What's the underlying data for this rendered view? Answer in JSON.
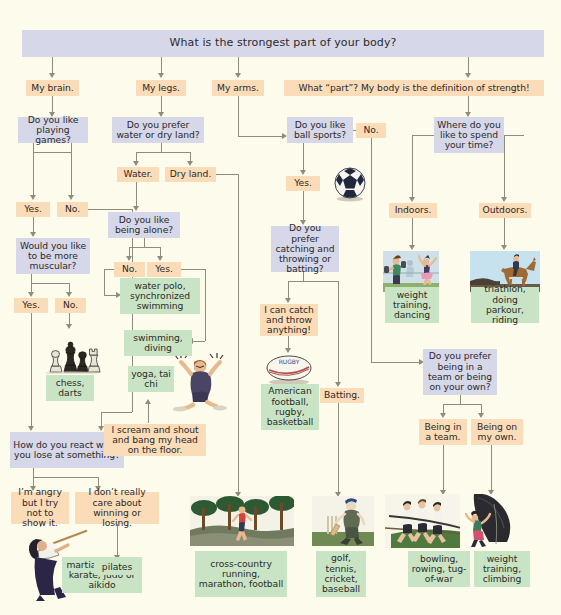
{
  "diagram": {
    "title": "What is the strongest part of your body?",
    "background_color": "#fdfbec",
    "question_color": "#d6d7e8",
    "answer_color": "#fbdcb8",
    "result_color": "#c9e4c4",
    "connector_color": "#8d8d7e"
  },
  "nodes": {
    "q_root": "What is the strongest part of your body?",
    "a_brain": "My brain.",
    "a_legs": "My legs.",
    "a_arms": "My arms.",
    "a_whatpart": "What “part”? My body is the definition of strength!",
    "q_games": "Do you like playing games?",
    "a_games_yes": "Yes.",
    "a_games_no": "No.",
    "q_muscular": "Would you like to be more muscular?",
    "a_musc_yes": "Yes.",
    "a_musc_no": "No.",
    "r_chess": "chess, darts",
    "q_lose": "How do you react when you lose at something?",
    "a_angry": "I’m angry but I try not to show it.",
    "a_dontcare": "I don’t really care about winning or losing.",
    "r_martial": "martial arts like karate, judo or aikido",
    "r_pilates": "pilates",
    "q_water": "Do you prefer water or dry land?",
    "a_water": "Water.",
    "a_dryland": "Dry land.",
    "q_alone": "Do you like being alone?",
    "a_alone_no": "No.",
    "a_alone_yes": "Yes.",
    "r_waterpolo": "water polo, synchronized swimming",
    "r_swimming": "swimming, diving",
    "r_yoga": "yoga, tai chi",
    "a_scream": "I scream and shout and bang my head on the floor.",
    "r_crosscountry": "cross-country running, marathon, football",
    "q_ball": "Do you like ball sports?",
    "a_ball_no": "No.",
    "a_ball_yes": "Yes.",
    "q_catch": "Do you prefer catching and throwing or batting?",
    "a_cancatch": "I can catch and throw anything!",
    "r_amfootball": "American football, rugby, basketball",
    "a_batting": "Batting.",
    "r_golf": "golf, tennis, cricket, baseball",
    "q_where": "Where do you like to spend your time?",
    "a_indoors": "Indoors.",
    "a_outdoors": "Outdoors.",
    "r_weightdance": "weight training, dancing",
    "r_triathlon": "triathlon, doing parkour, riding",
    "q_team": "Do you prefer being in a team or being on your own?",
    "a_inteam": "Being in a team.",
    "a_myown": "Being on my own.",
    "r_bowling": "bowling, rowing, tug-of-war",
    "r_weightclimb": "weight training, climbing"
  },
  "illustrations": {
    "chess": "chess-pieces-illustration",
    "soccer": "soccer-ball-illustration",
    "scream": "person-shouting-illustration",
    "rugby": "rugby-ball-illustration",
    "runner": "cross-country-runner-illustration",
    "kendo": "martial-arts-kendo-illustration",
    "cricket": "cricket-batsman-illustration",
    "tugofwar": "tug-of-war-team-illustration",
    "climber": "rock-climber-illustration",
    "gym": "weight-training-dancing-illustration",
    "horse": "horse-riding-illustration"
  }
}
